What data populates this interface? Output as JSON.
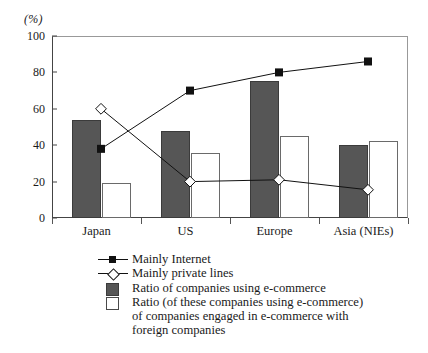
{
  "chart_data": {
    "type": "bar",
    "title": "",
    "xlabel": "",
    "ylabel": "(%)",
    "ylim": [
      0,
      100
    ],
    "yticks": [
      0,
      20,
      40,
      60,
      80,
      100
    ],
    "grid": false,
    "legend_position": "below",
    "categories": [
      "Japan",
      "US",
      "Europe",
      "Asia (NIEs)"
    ],
    "series": [
      {
        "name": "Ratio of companies using e-commerce",
        "type": "bar",
        "style": "filled-dark",
        "values": [
          54,
          48,
          75.5,
          40
        ]
      },
      {
        "name": "Ratio (of these companies using e-commerce) of companies engaged in e-commerce with foreign companies",
        "type": "bar",
        "style": "open",
        "values": [
          19,
          35.5,
          45,
          42.5
        ]
      },
      {
        "name": "Mainly Internet",
        "type": "line",
        "marker": "filled-square",
        "values": [
          38,
          70,
          80,
          86
        ]
      },
      {
        "name": "Mainly private lines",
        "type": "line",
        "marker": "open-diamond",
        "values": [
          60,
          20,
          21,
          15.5
        ]
      }
    ]
  },
  "axis": {
    "unit_label": "(%)",
    "tick_labels": [
      "100",
      "80",
      "60",
      "40",
      "20",
      "0"
    ]
  },
  "legend": {
    "items": [
      {
        "marker": "line-filled-square",
        "label": "Mainly Internet",
        "extra_lines": []
      },
      {
        "marker": "line-open-diamond",
        "label": "Mainly private lines",
        "extra_lines": []
      },
      {
        "marker": "box-dark",
        "label": "Ratio of companies using e-commerce",
        "extra_lines": []
      },
      {
        "marker": "box-open",
        "label": "Ratio (of these companies using e-commerce)",
        "extra_lines": [
          "of companies engaged in e-commerce with",
          "foreign companies"
        ]
      }
    ]
  },
  "colors": {
    "bar_dark": "#565656",
    "bar_open_border": "#6a6a6a",
    "line": "#111111",
    "axis": "#444444",
    "background": "#ffffff"
  }
}
